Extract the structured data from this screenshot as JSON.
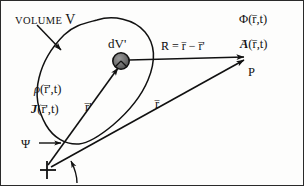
{
  "figure": {
    "kind": "physics-diagram",
    "topic": "retarded-potentials-source-volume",
    "background_color": "#fdfdfc",
    "ink_color": "#111111",
    "border_color": "#2a2a2a"
  },
  "labels": {
    "volume_prefix": "VOLUME",
    "volume_symbol": "V",
    "volume_element": "dV'",
    "charge_density": "ρ(r̄',t)",
    "charge_density_symbol": "ρ",
    "current_density_symbol": "J",
    "current_density_args": "(r̄',t)",
    "source_vector": "r'",
    "field_vector": "r",
    "separation_equation_lhs": "R",
    "separation_equation_rhs": "= r − r'",
    "scalar_potential_symbol": "Φ",
    "scalar_potential_args": "(r̄,t)",
    "vector_potential_symbol": "A",
    "vector_potential_args": "(r̄,t)",
    "observation_point": "P",
    "angle_symbol": "Ψ",
    "vector_bar": "–",
    "origin_marker": "+"
  },
  "elements": {
    "volume_outline_name": "volume-boundary-curve",
    "source_point_fill": "#6e6e6e",
    "source_point_stroke": "#111111",
    "arrow_volume_label": "volume-callout-arrow",
    "arrow_psi": "psi-callout-arrow",
    "arrow_origin": "origin-callout-arrow"
  },
  "geometry": {
    "source_point": {
      "x": 120,
      "y": 60
    },
    "observation_point": {
      "x": 243,
      "y": 57
    },
    "origin_point": {
      "x": 46,
      "y": 166
    },
    "canvas": {
      "width": 304,
      "height": 186
    }
  }
}
